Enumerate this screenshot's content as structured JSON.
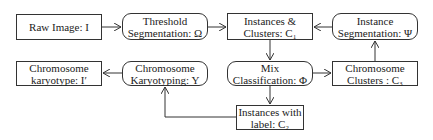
{
  "diagram": {
    "nodes": [
      {
        "id": "raw-image",
        "shape": "rect",
        "lines": [
          "Raw Image: I"
        ],
        "x": 16,
        "y": 14,
        "w": 86,
        "h": 26
      },
      {
        "id": "threshold-segmentation",
        "shape": "rounded",
        "lines": [
          "Threshold",
          "Segmentation:  Ω"
        ],
        "x": 122,
        "y": 13,
        "w": 86,
        "h": 27
      },
      {
        "id": "instances-clusters",
        "shape": "rect",
        "lines": [
          "Instances &",
          "Clusters: C₁"
        ],
        "x": 227,
        "y": 13,
        "w": 86,
        "h": 27
      },
      {
        "id": "instance-segmentation",
        "shape": "rounded",
        "lines": [
          "Instance",
          "Segmentation:  Ψ"
        ],
        "x": 332,
        "y": 13,
        "w": 86,
        "h": 27
      },
      {
        "id": "chromosome-karyotype",
        "shape": "rect",
        "lines": [
          "Chromosome",
          "karyotype: I′"
        ],
        "x": 16,
        "y": 61,
        "w": 86,
        "h": 25
      },
      {
        "id": "chromosome-karyotyping",
        "shape": "rounded",
        "lines": [
          "Chromosome",
          "Karyotyping: Y"
        ],
        "x": 122,
        "y": 61,
        "w": 86,
        "h": 25
      },
      {
        "id": "mix-classification",
        "shape": "rounded",
        "lines": [
          "Mix",
          "Classification:  Φ"
        ],
        "x": 227,
        "y": 61,
        "w": 86,
        "h": 25
      },
      {
        "id": "chromosome-clusters",
        "shape": "rect",
        "lines": [
          "Chromosome",
          "Clusters : C₃"
        ],
        "x": 332,
        "y": 61,
        "w": 86,
        "h": 25
      },
      {
        "id": "instances-with-label",
        "shape": "rect",
        "lines": [
          "Instances with",
          "label: C₂"
        ],
        "x": 236,
        "y": 105,
        "w": 68,
        "h": 25
      }
    ],
    "edges": [
      {
        "from": "raw-image",
        "to": "threshold-segmentation"
      },
      {
        "from": "threshold-segmentation",
        "to": "instances-clusters"
      },
      {
        "from": "instance-segmentation",
        "to": "instances-clusters"
      },
      {
        "from": "instances-clusters",
        "to": "mix-classification"
      },
      {
        "from": "chromosome-clusters",
        "to": "instance-segmentation"
      },
      {
        "from": "mix-classification",
        "to": "chromosome-clusters"
      },
      {
        "from": "mix-classification",
        "to": "instances-with-label"
      },
      {
        "from": "instances-with-label",
        "to": "chromosome-karyotyping"
      },
      {
        "from": "chromosome-karyotyping",
        "to": "chromosome-karyotype"
      }
    ],
    "colors": {
      "stroke": "#333333",
      "background": "#ffffff",
      "text": "#222222"
    }
  }
}
